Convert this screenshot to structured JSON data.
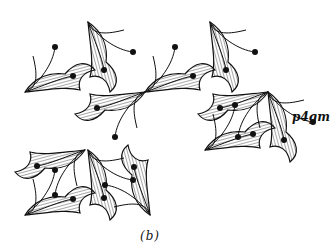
{
  "figure": {
    "group_label": "p4gm",
    "caption": "(b)",
    "ink_color": "#111111",
    "background_color": "#ffffff"
  }
}
